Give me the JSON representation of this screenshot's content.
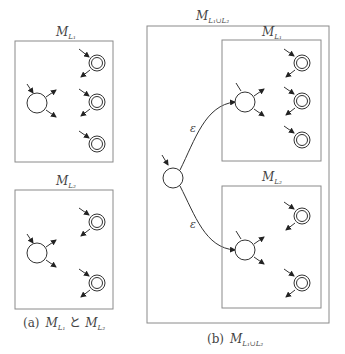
{
  "figure": {
    "panel_a": {
      "caption_prefix": "(a)",
      "caption_m1": "M",
      "caption_sub1": "L₁",
      "caption_join": "と",
      "caption_m2": "M",
      "caption_sub2": "L₂",
      "machine1": {
        "label": "M",
        "sub": "L₁",
        "final_states": 3
      },
      "machine2": {
        "label": "M",
        "sub": "L₂",
        "final_states": 2
      }
    },
    "panel_b": {
      "caption_prefix": "(b)",
      "caption_m": "M",
      "caption_sub": "L₁∪L₂",
      "outer_label": "M",
      "outer_sub": "L₁∪L₂",
      "machine1": {
        "label": "M",
        "sub": "L₁",
        "final_states": 3
      },
      "machine2": {
        "label": "M",
        "sub": "L₂",
        "final_states": 2
      },
      "epsilon_top": "ε",
      "epsilon_bottom": "ε"
    }
  }
}
